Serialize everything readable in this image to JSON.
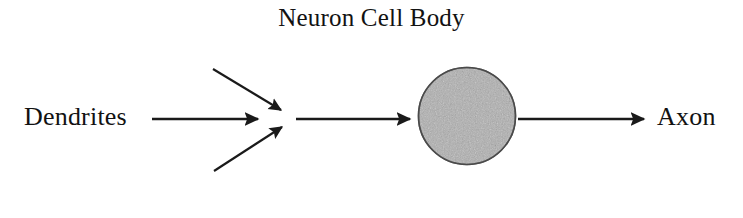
{
  "diagram": {
    "title": "Neuron Cell Body",
    "background_color": "#ffffff",
    "stroke_color": "#1a1a1a",
    "labels": {
      "input": "Dendrites",
      "output": "Axon"
    },
    "cell_body": {
      "name": "Neuron Cell Body",
      "shape": "circle",
      "fill_color": "#b0b0b0",
      "outline_color": "#4a4a4a",
      "center_x": 467,
      "center_y": 116,
      "radius": 48
    },
    "arrows": [
      {
        "name": "dendrite-main-arrow",
        "from_x": 152,
        "from_y": 119,
        "to_x": 262,
        "to_y": 119,
        "direction": "right"
      },
      {
        "name": "dendrite-upper-branch-arrow",
        "from_x": 213,
        "from_y": 69,
        "to_x": 285,
        "to_y": 113,
        "direction": "down-right"
      },
      {
        "name": "dendrite-lower-branch-arrow",
        "from_x": 214,
        "from_y": 171,
        "to_x": 286,
        "to_y": 124,
        "direction": "up-right"
      },
      {
        "name": "soma-input-arrow",
        "from_x": 296,
        "from_y": 119,
        "to_x": 414,
        "to_y": 119,
        "direction": "right"
      },
      {
        "name": "axon-output-arrow",
        "from_x": 518,
        "from_y": 119,
        "to_x": 648,
        "to_y": 119,
        "direction": "right"
      }
    ]
  }
}
